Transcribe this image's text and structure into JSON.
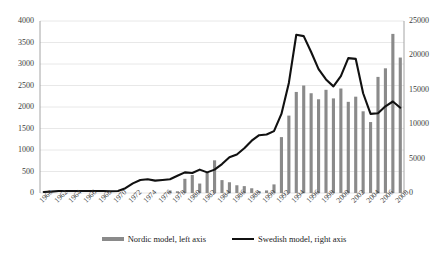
{
  "chart_data": {
    "type": "bar",
    "title": "",
    "subtitle": "",
    "xlabel": "",
    "ylabel": "",
    "grid": true,
    "legend_position": "bottom",
    "x": [
      1960,
      1961,
      1962,
      1963,
      1964,
      1965,
      1966,
      1967,
      1968,
      1969,
      1970,
      1971,
      1972,
      1973,
      1974,
      1975,
      1976,
      1977,
      1978,
      1979,
      1980,
      1981,
      1982,
      1983,
      1984,
      1985,
      1986,
      1987,
      1988,
      1989,
      1990,
      1991,
      1992,
      1993,
      1994,
      1995,
      1996,
      1997,
      1998,
      1999,
      2000,
      2001,
      2002,
      2003,
      2004,
      2005,
      2006,
      2007,
      2008
    ],
    "xticks": [
      "1960",
      "1962",
      "1964",
      "1966",
      "1968",
      "1970",
      "1972",
      "1974",
      "1976",
      "1978",
      "1980",
      "1982",
      "1984",
      "1986",
      "1988",
      "1990",
      "1992",
      "1994",
      "1996",
      "1998",
      "2000",
      "2002",
      "2004",
      "2006",
      "2008"
    ],
    "yticks_left": [
      0,
      500,
      1000,
      1500,
      2000,
      2500,
      3000,
      3500,
      4000
    ],
    "yticks_right": [
      0,
      5000,
      10000,
      15000,
      20000,
      25000
    ],
    "ylim_left": [
      0,
      4000
    ],
    "ylim_right": [
      0,
      25000
    ],
    "series": [
      {
        "name": "Nordic model, left axis",
        "axis": "left",
        "render": "bar",
        "color": "#8a8a8a",
        "values": [
          0,
          0,
          0,
          0,
          0,
          0,
          0,
          0,
          0,
          0,
          0,
          0,
          0,
          0,
          0,
          0,
          0,
          60,
          40,
          330,
          420,
          220,
          470,
          760,
          300,
          250,
          180,
          160,
          110,
          40,
          60,
          200,
          1300,
          1800,
          2350,
          2500,
          2320,
          2180,
          2400,
          2200,
          2430,
          2120,
          2240,
          1900,
          1650,
          2700,
          2900,
          3700,
          3150
        ]
      },
      {
        "name": "Swedish model, right axis",
        "axis": "right",
        "render": "line",
        "color": "#111111",
        "values": [
          150,
          200,
          280,
          300,
          300,
          300,
          300,
          300,
          280,
          260,
          280,
          700,
          1400,
          1900,
          2000,
          1800,
          1900,
          2000,
          2500,
          3000,
          2900,
          3400,
          3000,
          3400,
          4200,
          5200,
          5600,
          6500,
          7600,
          8400,
          8500,
          9000,
          11500,
          16000,
          23000,
          22800,
          20500,
          18000,
          16500,
          15500,
          17000,
          19600,
          19500,
          14500,
          11500,
          11600,
          12600,
          13300,
          12400
        ]
      }
    ]
  },
  "legend": {
    "items": [
      {
        "label": "Nordic model, left axis",
        "marker": "bar-swatch",
        "color": "#8a8a8a"
      },
      {
        "label": "Swedish model, right axis",
        "marker": "line-swatch",
        "color": "#111111"
      }
    ]
  },
  "colors": {
    "bar": "#8a8a8a",
    "line": "#111111",
    "grid": "#e2e2e2",
    "axis": "#9a9a9a",
    "text": "#3b3b3b",
    "background": "#ffffff"
  }
}
